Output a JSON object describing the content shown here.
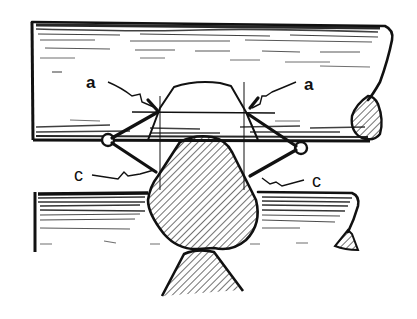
{
  "diagram": {
    "colors": {
      "ink": "#111111",
      "paper": "#ffffff"
    },
    "labels": [
      {
        "id": "a-left",
        "text": "a",
        "x": 86,
        "y": 74
      },
      {
        "id": "a-right",
        "text": "a",
        "x": 304,
        "y": 76
      },
      {
        "id": "c-left",
        "text": "c",
        "x": 74,
        "y": 169
      },
      {
        "id": "c-right",
        "text": "c",
        "x": 312,
        "y": 175
      }
    ],
    "parts": [
      {
        "name": "upper-log",
        "description": "horizontal log with wood grain, rounded right end with hatched cross-section"
      },
      {
        "name": "lower-log",
        "description": "horizontal log with wood grain, right end tapering with hatched tip"
      },
      {
        "name": "notch-outline",
        "description": "trapezoidal notch outline cut into upper log"
      },
      {
        "name": "round-log-section",
        "description": "hatched rounded log cross-section fitting the notch"
      },
      {
        "name": "support-log-section",
        "description": "hatched triangular section below"
      },
      {
        "name": "scribe-tools",
        "description": "two scribe/dividers with circle pivots crossing at the notch corners"
      }
    ]
  }
}
